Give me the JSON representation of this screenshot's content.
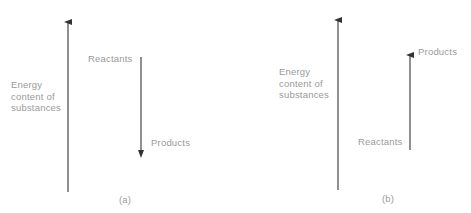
{
  "panels": [
    {
      "id": "a",
      "caption": "(a)",
      "axis_label_lines": [
        "Energy",
        "content of",
        "substances"
      ],
      "upper_label": "Reactants",
      "lower_label": "Products",
      "change_arrow_direction": "down"
    },
    {
      "id": "b",
      "caption": "(b)",
      "axis_label_lines": [
        "Energy",
        "content of",
        "substances"
      ],
      "upper_label": "Products",
      "lower_label": "Reactants",
      "change_arrow_direction": "up"
    }
  ],
  "colors": {
    "text": "#9a9a9a",
    "arrow": "#555555"
  }
}
